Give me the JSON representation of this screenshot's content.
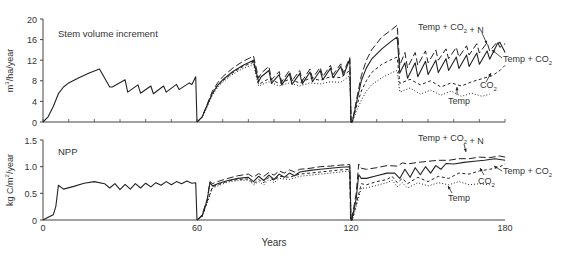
{
  "chart_data": [
    {
      "type": "line",
      "title": "Stem volume increment",
      "xlabel": "Years",
      "ylabel": "m3/ha/year",
      "ylabel_display": {
        "base": "m",
        "sup": "3",
        "rest": "/ha/year"
      },
      "xlim": [
        0,
        180
      ],
      "ylim": [
        0,
        20
      ],
      "yticks": [
        0,
        4,
        8,
        12,
        16,
        20
      ],
      "grid": false,
      "legend": "annotations",
      "annotations": [
        {
          "text": "Temp + CO2 + N",
          "x_px": 418,
          "y_px": 30
        },
        {
          "text": "Temp + CO2",
          "x_px": 503,
          "y_px": 62
        },
        {
          "text": "CO2",
          "x_px": 480,
          "y_px": 88
        },
        {
          "text": "Temp",
          "x_px": 448,
          "y_px": 104
        }
      ],
      "series": [
        {
          "name": "Baseline",
          "style": "solid",
          "x": [
            0,
            2,
            4,
            6,
            8,
            10,
            14,
            18,
            22,
            26,
            27,
            32,
            33,
            37,
            38,
            42,
            43,
            47,
            48,
            52,
            53,
            57,
            58,
            59.5,
            60
          ],
          "y": [
            0,
            1,
            3,
            5.5,
            6.8,
            7.6,
            8.6,
            9.5,
            10.3,
            6.8,
            6.8,
            8.2,
            5.8,
            7.2,
            5.6,
            7,
            5.5,
            7,
            5.8,
            7.3,
            6.3,
            7.6,
            7.3,
            8.8,
            0
          ]
        },
        {
          "name": "Temp + CO2 + N",
          "style": "longdash",
          "x": [
            60,
            62,
            64,
            66,
            68,
            70,
            74,
            78,
            82,
            84,
            85,
            88,
            89,
            92,
            93,
            96,
            97,
            100,
            101,
            104,
            105,
            108,
            109,
            112,
            113,
            116,
            117,
            119.5,
            120,
            120.5,
            122,
            124,
            126,
            128,
            132,
            136,
            138,
            139,
            141,
            142,
            145,
            146,
            149,
            150,
            153,
            154,
            157,
            158,
            161,
            162,
            165,
            166,
            169,
            170,
            173,
            174,
            177,
            178,
            180
          ],
          "y": [
            0,
            1,
            3.5,
            6,
            7.6,
            8.8,
            10.5,
            11.8,
            12.8,
            8.5,
            9.5,
            10.8,
            8.2,
            9.8,
            7.8,
            10,
            8,
            10,
            8,
            10.3,
            8.5,
            10.6,
            8.8,
            11,
            9.2,
            11.3,
            9.6,
            12.5,
            0,
            0,
            4,
            9,
            12,
            14,
            16.5,
            18,
            18.8,
            11,
            13.5,
            10.5,
            13.5,
            11,
            13.8,
            11.5,
            14,
            12,
            14.2,
            12.3,
            14.5,
            12.6,
            14.8,
            13,
            15.2,
            13.4,
            15.4,
            13.8,
            15.6,
            14.5,
            15.2
          ]
        },
        {
          "name": "Temp + CO2",
          "style": "solid",
          "x": [
            60,
            62,
            64,
            66,
            68,
            70,
            74,
            78,
            82,
            84,
            85,
            88,
            89,
            92,
            93,
            96,
            97,
            100,
            101,
            104,
            105,
            108,
            109,
            112,
            113,
            116,
            117,
            119.5,
            120,
            120.5,
            122,
            124,
            126,
            128,
            132,
            136,
            138,
            139,
            141,
            142,
            145,
            146,
            149,
            150,
            153,
            154,
            157,
            158,
            161,
            162,
            165,
            166,
            169,
            170,
            173,
            174,
            177,
            178,
            180
          ],
          "y": [
            0,
            1,
            3.3,
            5.6,
            7.1,
            8.2,
            9.8,
            11,
            12,
            7.8,
            8.8,
            10,
            7.5,
            9.2,
            7.2,
            9.4,
            7.3,
            9.4,
            7.4,
            9.7,
            7.8,
            10,
            8.2,
            10.4,
            8.6,
            10.8,
            9,
            12.2,
            0,
            0,
            3.5,
            8,
            10.5,
            12.2,
            14.2,
            15.8,
            16.5,
            9.5,
            11.5,
            8.5,
            11.5,
            8.8,
            11.8,
            9.2,
            12,
            9.6,
            12.3,
            10,
            12.6,
            10.4,
            13,
            10.8,
            13.4,
            11.2,
            13.8,
            12.2,
            15.2,
            15.5,
            13.5
          ]
        },
        {
          "name": "CO2",
          "style": "dashed",
          "x": [
            60,
            62,
            64,
            66,
            68,
            70,
            74,
            78,
            82,
            84,
            88,
            92,
            96,
            100,
            104,
            108,
            112,
            116,
            119.5,
            120,
            120.5,
            122,
            124,
            126,
            128,
            132,
            136,
            138,
            139,
            143,
            147,
            151,
            155,
            159,
            163,
            167,
            171,
            175,
            178,
            180
          ],
          "y": [
            0,
            1,
            3.3,
            5.5,
            7,
            8,
            9.6,
            10.8,
            11.6,
            7.3,
            8.4,
            7.5,
            8.3,
            7.6,
            8.5,
            8.1,
            8.8,
            8.6,
            10,
            0,
            0,
            2.8,
            6,
            8,
            9.6,
            11.2,
            12.2,
            12.6,
            7.5,
            8.3,
            7.2,
            8,
            6.8,
            7.6,
            7,
            7.8,
            8.4,
            9,
            10,
            11
          ]
        },
        {
          "name": "Temp",
          "style": "dotted",
          "x": [
            60,
            62,
            64,
            66,
            68,
            70,
            74,
            78,
            82,
            84,
            88,
            92,
            96,
            100,
            104,
            108,
            112,
            116,
            119.5,
            120,
            120.5,
            122,
            124,
            126,
            128,
            132,
            136,
            138,
            139,
            143,
            147,
            151,
            155,
            159,
            163,
            167,
            171,
            174
          ],
          "y": [
            0,
            0.8,
            3,
            5.2,
            6.7,
            7.7,
            9.3,
            10.4,
            11.2,
            7,
            7.8,
            7,
            7.6,
            7,
            7.6,
            7.4,
            7.8,
            7.7,
            9,
            0,
            0,
            2,
            4.2,
            6,
            7.2,
            8.6,
            9.6,
            10,
            5.8,
            6.6,
            5.4,
            6.2,
            5.2,
            6,
            5,
            5.6,
            5,
            5.4
          ]
        }
      ]
    },
    {
      "type": "line",
      "title": "NPP",
      "xlabel": "Years",
      "ylabel": "kg C/m2/year",
      "ylabel_display": {
        "base": "kg C/m",
        "sup": "2",
        "rest": "/year"
      },
      "xlim": [
        0,
        180
      ],
      "ylim": [
        0,
        1.5
      ],
      "yticks": [
        0,
        0.5,
        1.0,
        1.5
      ],
      "xticks": [
        0,
        60,
        120,
        180
      ],
      "grid": false,
      "legend": "annotations",
      "annotations": [
        {
          "text": "Temp + CO2 + N",
          "x_px": 418,
          "y_px": 141
        },
        {
          "text": "Temp + CO2",
          "x_px": 503,
          "y_px": 174
        },
        {
          "text": "CO2",
          "x_px": 478,
          "y_px": 184
        },
        {
          "text": "Temp",
          "x_px": 448,
          "y_px": 201
        }
      ],
      "series": [
        {
          "name": "Baseline",
          "style": "solid",
          "x": [
            0,
            2,
            4,
            5,
            6,
            8,
            12,
            16,
            20,
            24,
            26,
            28,
            30,
            32,
            34,
            36,
            38,
            40,
            42,
            44,
            46,
            48,
            50,
            52,
            54,
            56,
            58,
            59.5,
            60
          ],
          "y": [
            0,
            0.05,
            0.1,
            0.25,
            0.65,
            0.58,
            0.63,
            0.69,
            0.72,
            0.68,
            0.6,
            0.68,
            0.57,
            0.67,
            0.58,
            0.68,
            0.6,
            0.69,
            0.62,
            0.7,
            0.65,
            0.72,
            0.66,
            0.72,
            0.68,
            0.73,
            0.69,
            0.7,
            0
          ]
        },
        {
          "name": "Temp + CO2 + N",
          "style": "longdash",
          "x": [
            60,
            62,
            64,
            65,
            66,
            68,
            72,
            76,
            80,
            82,
            84,
            86,
            88,
            90,
            92,
            94,
            96,
            98,
            100,
            104,
            108,
            112,
            116,
            119.5,
            119.8,
            120.2,
            122,
            123,
            124,
            126,
            130,
            134,
            138,
            140,
            142,
            146,
            150,
            154,
            158,
            162,
            166,
            170,
            174,
            178,
            180
          ],
          "y": [
            0,
            0.1,
            0.4,
            0.72,
            0.68,
            0.72,
            0.78,
            0.83,
            0.86,
            0.8,
            0.87,
            0.82,
            0.89,
            0.84,
            0.92,
            0.88,
            0.94,
            0.9,
            0.95,
            0.97,
            1.0,
            1.01,
            1.03,
            1.04,
            0,
            0,
            0.5,
            1.05,
            0.97,
            0.95,
            0.98,
            1.02,
            1.01,
            1.07,
            1.05,
            1.08,
            1.1,
            1.12,
            1.12,
            1.15,
            1.15,
            1.18,
            1.17,
            1.2,
            1.18
          ]
        },
        {
          "name": "Temp + CO2",
          "style": "solid",
          "x": [
            60,
            62,
            64,
            65,
            66,
            68,
            72,
            76,
            80,
            82,
            84,
            86,
            88,
            90,
            92,
            94,
            96,
            98,
            100,
            104,
            108,
            112,
            116,
            119.5,
            120,
            120.3,
            122,
            123,
            124,
            126,
            130,
            134,
            137,
            139,
            141,
            143,
            145,
            147,
            149,
            151,
            153,
            155,
            157,
            160,
            164,
            168,
            172,
            176,
            180
          ],
          "y": [
            0,
            0.08,
            0.38,
            0.7,
            0.64,
            0.68,
            0.74,
            0.78,
            0.8,
            0.72,
            0.82,
            0.74,
            0.84,
            0.76,
            0.86,
            0.8,
            0.88,
            0.83,
            0.9,
            0.93,
            0.95,
            0.97,
            0.99,
            1.0,
            0,
            0,
            0.4,
            0.85,
            0.78,
            0.78,
            0.83,
            0.88,
            0.88,
            0.78,
            0.95,
            0.8,
            0.98,
            0.85,
            1.0,
            0.88,
            1.02,
            0.95,
            1.06,
            1.05,
            1.08,
            1.1,
            1.12,
            1.15,
            1.12
          ]
        },
        {
          "name": "CO2",
          "style": "dashed",
          "x": [
            60,
            62,
            64,
            66,
            68,
            72,
            76,
            80,
            82,
            84,
            86,
            88,
            90,
            92,
            96,
            100,
            104,
            108,
            112,
            116,
            119.5,
            120,
            120.5,
            122,
            124,
            126,
            130,
            134,
            136,
            138,
            140,
            142,
            146,
            150,
            154,
            158,
            162,
            166,
            170,
            174,
            178,
            180
          ],
          "y": [
            0,
            0.07,
            0.35,
            0.62,
            0.66,
            0.73,
            0.76,
            0.77,
            0.68,
            0.76,
            0.7,
            0.8,
            0.74,
            0.82,
            0.8,
            0.86,
            0.88,
            0.9,
            0.92,
            0.94,
            0.95,
            0,
            0,
            0.3,
            0.68,
            0.66,
            0.72,
            0.76,
            0.82,
            0.7,
            0.78,
            0.68,
            0.8,
            0.72,
            0.82,
            0.78,
            0.88,
            0.86,
            0.92,
            0.95,
            1.0,
            1.05
          ]
        },
        {
          "name": "Temp",
          "style": "dotted",
          "x": [
            60,
            62,
            64,
            66,
            68,
            72,
            76,
            80,
            82,
            84,
            86,
            88,
            90,
            92,
            96,
            100,
            104,
            108,
            112,
            116,
            119.5,
            120,
            120.5,
            122,
            124,
            126,
            130,
            134,
            136,
            138,
            140,
            142,
            146,
            150,
            154,
            158,
            162,
            166,
            170,
            174
          ],
          "y": [
            0,
            0.06,
            0.32,
            0.6,
            0.64,
            0.71,
            0.74,
            0.75,
            0.66,
            0.72,
            0.66,
            0.76,
            0.7,
            0.78,
            0.76,
            0.82,
            0.84,
            0.86,
            0.88,
            0.9,
            0.92,
            0,
            0,
            0.25,
            0.6,
            0.6,
            0.65,
            0.7,
            0.75,
            0.62,
            0.7,
            0.6,
            0.7,
            0.64,
            0.7,
            0.66,
            0.72,
            0.66,
            0.68,
            0.66
          ]
        }
      ]
    }
  ],
  "layout": {
    "x0_px": 43,
    "px_per_year": 2.567,
    "panels": [
      {
        "y0_px": 122,
        "y_top_px": 19
      },
      {
        "y0_px": 220,
        "y_top_px": 140
      }
    ]
  }
}
